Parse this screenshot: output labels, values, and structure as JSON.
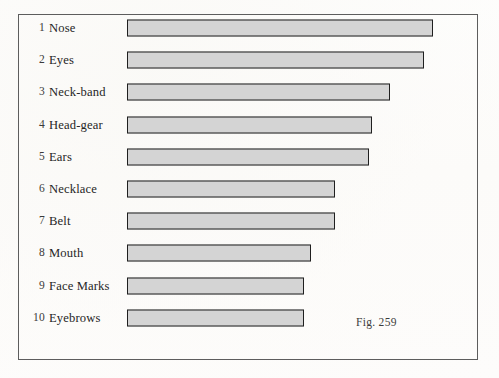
{
  "figure": {
    "caption": "Fig. 259",
    "frame_color": "#5d5d5d",
    "bar_border_color": "#1f1f1f",
    "bar_fill_color": "#d2d2d2",
    "paper_color": "#fdfdfc"
  },
  "chart_data": {
    "type": "bar",
    "orientation": "horizontal",
    "title": "",
    "subtitle": "",
    "xlabel": "",
    "ylabel": "",
    "annotations": [
      "Fig. 259"
    ],
    "grid": false,
    "legend": null,
    "axis_visible": false,
    "tick_labels": [],
    "xlim": [
      0,
      100
    ],
    "categories": [
      "Nose",
      "Eyes",
      "Neck-band",
      "Head-gear",
      "Ears",
      "Necklace",
      "Belt",
      "Mouth",
      "Face Marks",
      "Eyebrows"
    ],
    "ranks": [
      "1",
      "2",
      "3",
      "4",
      "5",
      "6",
      "7",
      "8",
      "9",
      "10"
    ],
    "values": [
      100,
      97,
      86,
      80,
      79,
      68,
      68,
      60,
      58,
      58
    ],
    "rows": [
      {
        "rank": "1",
        "label": "Nose",
        "value": 100
      },
      {
        "rank": "2",
        "label": "Eyes",
        "value": 97
      },
      {
        "rank": "3",
        "label": "Neck-band",
        "value": 86
      },
      {
        "rank": "4",
        "label": "Head-gear",
        "value": 80
      },
      {
        "rank": "5",
        "label": "Ears",
        "value": 79
      },
      {
        "rank": "6",
        "label": "Necklace",
        "value": 68
      },
      {
        "rank": "7",
        "label": "Belt",
        "value": 68
      },
      {
        "rank": "8",
        "label": "Mouth",
        "value": 60
      },
      {
        "rank": "9",
        "label": "Face Marks",
        "value": 58
      },
      {
        "rank": "10",
        "label": "Eyebrows",
        "value": 58
      }
    ]
  }
}
